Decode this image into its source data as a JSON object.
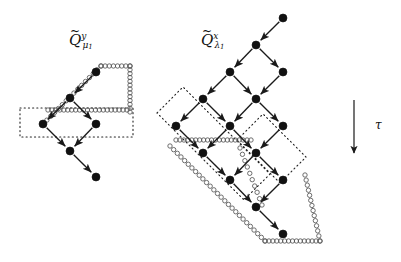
{
  "figure": {
    "width": 401,
    "height": 262,
    "background": "#ffffff",
    "ink": "#1a1a1a",
    "node_fill": "#111111",
    "node_radius": 4.0,
    "hollow_radius": 2.2,
    "hollow_stroke": "#555555",
    "dotted_stroke": "#222222",
    "arrow_stroke": "#1a1a1a"
  },
  "labels": {
    "left_quiver": {
      "tilde": "~",
      "base": "Q",
      "superscript": "y",
      "subscript": "μ",
      "subscript_index": "1",
      "plain": "Q̃ᵧμ₁",
      "x": 69,
      "y": 31
    },
    "right_quiver": {
      "tilde": "~",
      "base": "Q",
      "superscript": "x",
      "subscript": "λ",
      "subscript_index": "1",
      "plain": "Q̃ˣλ₁",
      "x": 201,
      "y": 31
    },
    "tau": {
      "text": "τ",
      "x": 375,
      "y": 118
    }
  },
  "tau_arrow": {
    "name": "tau-direction-arrow",
    "x": 354,
    "y1": 100,
    "y2": 160
  },
  "chart_data": {
    "type": "diagram",
    "left_graph": {
      "name": "Q-tilde-y-mu1",
      "nodes": [
        {
          "id": "L0",
          "x": 96,
          "y": 72
        },
        {
          "id": "L1",
          "x": 70,
          "y": 98
        },
        {
          "id": "L2",
          "x": 43,
          "y": 124
        },
        {
          "id": "L3",
          "x": 96,
          "y": 124
        },
        {
          "id": "L4",
          "x": 70,
          "y": 151
        },
        {
          "id": "L5",
          "x": 96,
          "y": 177
        }
      ],
      "edges": [
        {
          "from": "L0",
          "to": "L1"
        },
        {
          "from": "L1",
          "to": "L2"
        },
        {
          "from": "L1",
          "to": "L3"
        },
        {
          "from": "L2",
          "to": "L4"
        },
        {
          "from": "L3",
          "to": "L4"
        },
        {
          "from": "L4",
          "to": "L5"
        }
      ],
      "dotted_regions": [
        {
          "shape": "rect",
          "x": 20,
          "y": 108,
          "w": 113,
          "h": 29
        }
      ],
      "hollow_chains": [
        {
          "from_x": 43,
          "from_y": 124,
          "to_x": 101,
          "to_y": 66,
          "count": 16
        },
        {
          "from_x": 101,
          "from_y": 66,
          "to_x": 130,
          "to_y": 66,
          "count": 8
        },
        {
          "from_x": 130,
          "from_y": 66,
          "to_x": 130,
          "to_y": 112,
          "count": 13
        },
        {
          "from_x": 48,
          "from_y": 110,
          "to_x": 127,
          "to_y": 110,
          "count": 21
        }
      ]
    },
    "right_graph": {
      "name": "Q-tilde-x-lambda1",
      "nodes": [
        {
          "id": "R0",
          "x": 283,
          "y": 18
        },
        {
          "id": "R1",
          "x": 256,
          "y": 45
        },
        {
          "id": "R2",
          "x": 230,
          "y": 72
        },
        {
          "id": "R3",
          "x": 283,
          "y": 72
        },
        {
          "id": "R4",
          "x": 203,
          "y": 99
        },
        {
          "id": "R5",
          "x": 256,
          "y": 99
        },
        {
          "id": "R6",
          "x": 176,
          "y": 126
        },
        {
          "id": "R7",
          "x": 230,
          "y": 126
        },
        {
          "id": "R8",
          "x": 283,
          "y": 126
        },
        {
          "id": "R9",
          "x": 203,
          "y": 153
        },
        {
          "id": "R10",
          "x": 256,
          "y": 153
        },
        {
          "id": "R11",
          "x": 230,
          "y": 180
        },
        {
          "id": "R12",
          "x": 283,
          "y": 180
        },
        {
          "id": "R13",
          "x": 256,
          "y": 207
        },
        {
          "id": "R14",
          "x": 283,
          "y": 234
        }
      ],
      "edges": [
        {
          "from": "R0",
          "to": "R1"
        },
        {
          "from": "R1",
          "to": "R2"
        },
        {
          "from": "R1",
          "to": "R3"
        },
        {
          "from": "R2",
          "to": "R4"
        },
        {
          "from": "R2",
          "to": "R5"
        },
        {
          "from": "R3",
          "to": "R5"
        },
        {
          "from": "R4",
          "to": "R6"
        },
        {
          "from": "R4",
          "to": "R7"
        },
        {
          "from": "R5",
          "to": "R7"
        },
        {
          "from": "R5",
          "to": "R8"
        },
        {
          "from": "R6",
          "to": "R9"
        },
        {
          "from": "R7",
          "to": "R9"
        },
        {
          "from": "R7",
          "to": "R10"
        },
        {
          "from": "R8",
          "to": "R10"
        },
        {
          "from": "R9",
          "to": "R11"
        },
        {
          "from": "R10",
          "to": "R11"
        },
        {
          "from": "R10",
          "to": "R12"
        },
        {
          "from": "R11",
          "to": "R13"
        },
        {
          "from": "R12",
          "to": "R13"
        },
        {
          "from": "R13",
          "to": "R14"
        }
      ],
      "dotted_regions": [
        {
          "shape": "parallelogram",
          "points": "157,113 183,87 270,174 244,200"
        },
        {
          "shape": "parallelogram",
          "points": "237,140 263,114 306,157 280,183"
        }
      ],
      "hollow_chains": [
        {
          "from_x": 176,
          "from_y": 140,
          "to_x": 251,
          "to_y": 140,
          "count": 20
        },
        {
          "from_x": 170,
          "from_y": 146,
          "to_x": 265,
          "to_y": 241,
          "count": 27
        },
        {
          "from_x": 265,
          "from_y": 241,
          "to_x": 320,
          "to_y": 241,
          "count": 15
        },
        {
          "from_x": 320,
          "from_y": 241,
          "to_x": 305,
          "to_y": 175,
          "count": 14
        },
        {
          "from_x": 240,
          "from_y": 148,
          "to_x": 262,
          "to_y": 205,
          "count": 10
        }
      ]
    }
  }
}
